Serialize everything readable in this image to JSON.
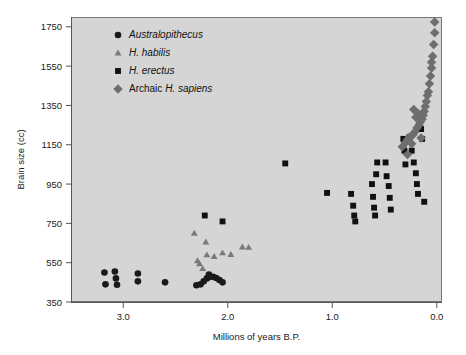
{
  "chart_data": {
    "type": "scatter",
    "title": "",
    "xlabel": "Millions of years B.P.",
    "ylabel": "Brain size (cc)",
    "xlim": [
      3.5,
      -0.05
    ],
    "ylim": [
      350,
      1800
    ],
    "x_ticks": [
      3.0,
      2.0,
      1.0,
      0.0
    ],
    "x_tick_labels": [
      "3.0",
      "2.0",
      "1.0",
      "0.0"
    ],
    "y_ticks": [
      350,
      550,
      750,
      950,
      1150,
      1350,
      1550,
      1750
    ],
    "y_tick_labels": [
      "350",
      "550",
      "750",
      "950",
      "1150",
      "1350",
      "1550",
      "1750"
    ],
    "x_axis_reversed": true,
    "grid": false,
    "legend_position": "top-left",
    "series": [
      {
        "name": "Australopithecus",
        "marker": "circle",
        "color": "#1a1a1a",
        "italic": true,
        "points": [
          [
            3.18,
            500
          ],
          [
            3.08,
            505
          ],
          [
            3.07,
            470
          ],
          [
            3.17,
            440
          ],
          [
            3.06,
            438
          ],
          [
            2.86,
            495
          ],
          [
            2.86,
            455
          ],
          [
            2.6,
            450
          ],
          [
            2.3,
            435
          ],
          [
            2.26,
            440
          ],
          [
            2.23,
            455
          ],
          [
            2.2,
            470
          ],
          [
            2.17,
            478
          ],
          [
            2.14,
            478
          ],
          [
            2.11,
            472
          ],
          [
            2.08,
            462
          ],
          [
            2.05,
            450
          ],
          [
            2.18,
            490
          ]
        ]
      },
      {
        "name": "H. habilis",
        "marker": "triangle",
        "color": "#7a7a7a",
        "italic": true,
        "points": [
          [
            2.29,
            560
          ],
          [
            2.27,
            545
          ],
          [
            2.24,
            520
          ],
          [
            2.2,
            590
          ],
          [
            2.13,
            582
          ],
          [
            2.05,
            600
          ],
          [
            1.97,
            592
          ],
          [
            1.86,
            630
          ],
          [
            1.8,
            628
          ],
          [
            2.32,
            700
          ],
          [
            2.21,
            655
          ]
        ]
      },
      {
        "name": "H. erectus",
        "marker": "square",
        "color": "#111111",
        "italic": true,
        "points": [
          [
            2.22,
            790
          ],
          [
            2.05,
            760
          ],
          [
            1.45,
            1055
          ],
          [
            1.05,
            905
          ],
          [
            0.82,
            900
          ],
          [
            0.8,
            840
          ],
          [
            0.79,
            790
          ],
          [
            0.78,
            760
          ],
          [
            0.62,
            950
          ],
          [
            0.61,
            885
          ],
          [
            0.6,
            830
          ],
          [
            0.59,
            790
          ],
          [
            0.58,
            1000
          ],
          [
            0.57,
            1060
          ],
          [
            0.49,
            1060
          ],
          [
            0.48,
            990
          ],
          [
            0.46,
            940
          ],
          [
            0.45,
            880
          ],
          [
            0.44,
            820
          ],
          [
            0.32,
            1180
          ],
          [
            0.31,
            1120
          ],
          [
            0.3,
            1050
          ],
          [
            0.26,
            1190
          ],
          [
            0.24,
            1120
          ],
          [
            0.22,
            1060
          ],
          [
            0.2,
            1005
          ],
          [
            0.19,
            950
          ],
          [
            0.18,
            900
          ],
          [
            0.15,
            1230
          ],
          [
            0.14,
            1180
          ],
          [
            0.12,
            860
          ]
        ]
      },
      {
        "name": "Archaic H. sapiens",
        "marker": "diamond",
        "color": "#6e6e6e",
        "italic": false,
        "label_italic_part": "H. sapiens",
        "points": [
          [
            0.02,
            1775
          ],
          [
            0.02,
            1720
          ],
          [
            0.03,
            1660
          ],
          [
            0.04,
            1600
          ],
          [
            0.05,
            1570
          ],
          [
            0.05,
            1540
          ],
          [
            0.06,
            1500
          ],
          [
            0.07,
            1460
          ],
          [
            0.08,
            1420
          ],
          [
            0.09,
            1400
          ],
          [
            0.1,
            1370
          ],
          [
            0.11,
            1345
          ],
          [
            0.12,
            1320
          ],
          [
            0.13,
            1300
          ],
          [
            0.14,
            1280
          ],
          [
            0.16,
            1265
          ],
          [
            0.17,
            1250
          ],
          [
            0.19,
            1235
          ],
          [
            0.21,
            1215
          ],
          [
            0.23,
            1200
          ],
          [
            0.26,
            1190
          ],
          [
            0.28,
            1175
          ],
          [
            0.2,
            1290
          ],
          [
            0.22,
            1330
          ],
          [
            0.18,
            1310
          ],
          [
            0.24,
            1155
          ],
          [
            0.3,
            1160
          ],
          [
            0.33,
            1140
          ],
          [
            0.15,
            1185
          ],
          [
            0.28,
            1100
          ]
        ]
      }
    ]
  },
  "legend": {
    "entries": [
      {
        "label": "Australopithecus",
        "marker": "circle-icon"
      },
      {
        "label": "H. habilis",
        "marker": "triangle-icon"
      },
      {
        "label": "H. erectus",
        "marker": "square-icon"
      },
      {
        "label": "Archaic H. sapiens",
        "marker": "diamond-icon"
      }
    ]
  },
  "colors": {
    "plot_background": "#d5d5d5",
    "page_background": "#ffffff",
    "axis": "#555555",
    "australopithecus": "#1a1a1a",
    "habilis": "#7a7a7a",
    "erectus": "#111111",
    "archaic_sapiens": "#6e6e6e"
  }
}
